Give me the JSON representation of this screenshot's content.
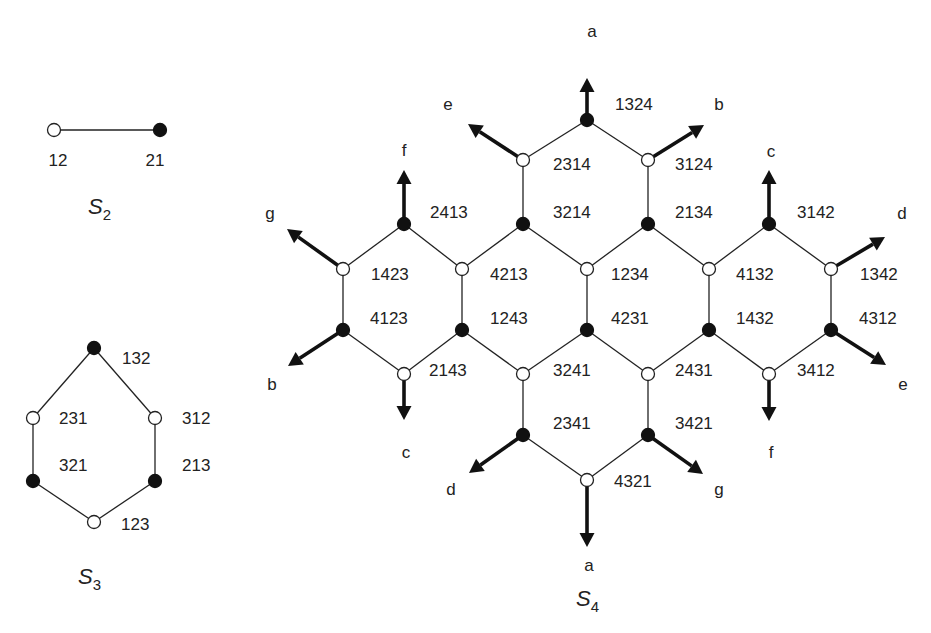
{
  "figure": {
    "colors": {
      "line": "#222222",
      "filled_node": "#111111",
      "open_node": "#ffffff",
      "background": "#ffffff"
    }
  },
  "panels": [
    {
      "id": "S2",
      "title": "S",
      "subscript": "2",
      "title_pos": [
        88,
        214
      ],
      "nodes": [
        {
          "id": "12",
          "x": 54,
          "y": 130,
          "type": "open",
          "label": "12",
          "lx": 58,
          "ly": 166,
          "anchor": "middle"
        },
        {
          "id": "21",
          "x": 160,
          "y": 130,
          "type": "filled",
          "label": "21",
          "lx": 155,
          "ly": 166,
          "anchor": "middle"
        }
      ],
      "edges": [
        [
          "12",
          "21"
        ]
      ],
      "arrows": []
    },
    {
      "id": "S3",
      "title": "S",
      "subscript": "3",
      "title_pos": [
        78,
        584
      ],
      "nodes": [
        {
          "id": "132",
          "x": 94,
          "y": 348,
          "type": "filled",
          "label": "132",
          "lx": 122,
          "ly": 364,
          "anchor": "start"
        },
        {
          "id": "231",
          "x": 33,
          "y": 418,
          "type": "open",
          "label": "231",
          "lx": 59,
          "ly": 424,
          "anchor": "start"
        },
        {
          "id": "312",
          "x": 155,
          "y": 418,
          "type": "open",
          "label": "312",
          "lx": 182,
          "ly": 424,
          "anchor": "start"
        },
        {
          "id": "321",
          "x": 33,
          "y": 481,
          "type": "filled",
          "label": "321",
          "lx": 59,
          "ly": 471,
          "anchor": "start"
        },
        {
          "id": "213",
          "x": 155,
          "y": 481,
          "type": "filled",
          "label": "213",
          "lx": 182,
          "ly": 471,
          "anchor": "start"
        },
        {
          "id": "123",
          "x": 94,
          "y": 522,
          "type": "open",
          "label": "123",
          "lx": 121,
          "ly": 530,
          "anchor": "start"
        }
      ],
      "edges": [
        [
          "132",
          "231"
        ],
        [
          "132",
          "312"
        ],
        [
          "231",
          "321"
        ],
        [
          "312",
          "213"
        ],
        [
          "321",
          "123"
        ],
        [
          "213",
          "123"
        ]
      ],
      "arrows": []
    },
    {
      "id": "S4",
      "title": "S",
      "subscript": "4",
      "title_pos": [
        576,
        606
      ],
      "nodes": [
        {
          "id": "1324",
          "x": 587,
          "y": 120,
          "type": "filled",
          "label": "1324",
          "lx": 615,
          "ly": 110,
          "anchor": "start"
        },
        {
          "id": "2314",
          "x": 523,
          "y": 160,
          "type": "open",
          "label": "2314",
          "lx": 553,
          "ly": 170,
          "anchor": "start"
        },
        {
          "id": "3124",
          "x": 648,
          "y": 160,
          "type": "open",
          "label": "3124",
          "lx": 675,
          "ly": 170,
          "anchor": "start"
        },
        {
          "id": "3214",
          "x": 523,
          "y": 224,
          "type": "filled",
          "label": "3214",
          "lx": 553,
          "ly": 218,
          "anchor": "start"
        },
        {
          "id": "2134",
          "x": 648,
          "y": 224,
          "type": "filled",
          "label": "2134",
          "lx": 675,
          "ly": 218,
          "anchor": "start"
        },
        {
          "id": "2413",
          "x": 404,
          "y": 224,
          "type": "filled",
          "label": "2413",
          "lx": 430,
          "ly": 218,
          "anchor": "start"
        },
        {
          "id": "3142",
          "x": 769,
          "y": 224,
          "type": "filled",
          "label": "3142",
          "lx": 797,
          "ly": 218,
          "anchor": "start"
        },
        {
          "id": "1423",
          "x": 343,
          "y": 269,
          "type": "open",
          "label": "1423",
          "lx": 371,
          "ly": 280,
          "anchor": "start"
        },
        {
          "id": "4213",
          "x": 462,
          "y": 269,
          "type": "open",
          "label": "4213",
          "lx": 490,
          "ly": 280,
          "anchor": "start"
        },
        {
          "id": "1234",
          "x": 587,
          "y": 269,
          "type": "open",
          "label": "1234",
          "lx": 611,
          "ly": 280,
          "anchor": "start"
        },
        {
          "id": "4132",
          "x": 709,
          "y": 269,
          "type": "open",
          "label": "4132",
          "lx": 736,
          "ly": 280,
          "anchor": "start"
        },
        {
          "id": "1342",
          "x": 831,
          "y": 269,
          "type": "open",
          "label": "1342",
          "lx": 860,
          "ly": 280,
          "anchor": "start"
        },
        {
          "id": "4123",
          "x": 343,
          "y": 330,
          "type": "filled",
          "label": "4123",
          "lx": 370,
          "ly": 324,
          "anchor": "start"
        },
        {
          "id": "1243",
          "x": 462,
          "y": 330,
          "type": "filled",
          "label": "1243",
          "lx": 490,
          "ly": 324,
          "anchor": "start"
        },
        {
          "id": "4231",
          "x": 587,
          "y": 330,
          "type": "filled",
          "label": "4231",
          "lx": 611,
          "ly": 324,
          "anchor": "start"
        },
        {
          "id": "1432",
          "x": 709,
          "y": 330,
          "type": "filled",
          "label": "1432",
          "lx": 736,
          "ly": 324,
          "anchor": "start"
        },
        {
          "id": "4312",
          "x": 831,
          "y": 330,
          "type": "filled",
          "label": "4312",
          "lx": 859,
          "ly": 324,
          "anchor": "start"
        },
        {
          "id": "2143",
          "x": 404,
          "y": 374,
          "type": "open",
          "label": "2143",
          "lx": 429,
          "ly": 376,
          "anchor": "start"
        },
        {
          "id": "3241",
          "x": 523,
          "y": 374,
          "type": "open",
          "label": "3241",
          "lx": 553,
          "ly": 376,
          "anchor": "start"
        },
        {
          "id": "2431",
          "x": 648,
          "y": 374,
          "type": "open",
          "label": "2431",
          "lx": 675,
          "ly": 376,
          "anchor": "start"
        },
        {
          "id": "3412",
          "x": 769,
          "y": 374,
          "type": "open",
          "label": "3412",
          "lx": 797,
          "ly": 376,
          "anchor": "start"
        },
        {
          "id": "2341",
          "x": 523,
          "y": 435,
          "type": "filled",
          "label": "2341",
          "lx": 553,
          "ly": 429,
          "anchor": "start"
        },
        {
          "id": "3421",
          "x": 648,
          "y": 435,
          "type": "filled",
          "label": "3421",
          "lx": 675,
          "ly": 429,
          "anchor": "start"
        },
        {
          "id": "4321",
          "x": 587,
          "y": 480,
          "type": "open",
          "label": "4321",
          "lx": 614,
          "ly": 487,
          "anchor": "start"
        }
      ],
      "edges": [
        [
          "1324",
          "2314"
        ],
        [
          "1324",
          "3124"
        ],
        [
          "2314",
          "3214"
        ],
        [
          "3124",
          "2134"
        ],
        [
          "2413",
          "1423"
        ],
        [
          "2413",
          "4213"
        ],
        [
          "3214",
          "4213"
        ],
        [
          "3214",
          "1234"
        ],
        [
          "2134",
          "1234"
        ],
        [
          "2134",
          "4132"
        ],
        [
          "3142",
          "4132"
        ],
        [
          "3142",
          "1342"
        ],
        [
          "1423",
          "4123"
        ],
        [
          "4213",
          "1243"
        ],
        [
          "1234",
          "4231"
        ],
        [
          "4132",
          "1432"
        ],
        [
          "1342",
          "4312"
        ],
        [
          "4123",
          "2143"
        ],
        [
          "1243",
          "2143"
        ],
        [
          "1243",
          "3241"
        ],
        [
          "4231",
          "3241"
        ],
        [
          "4231",
          "2431"
        ],
        [
          "1432",
          "2431"
        ],
        [
          "1432",
          "3412"
        ],
        [
          "4312",
          "3412"
        ],
        [
          "3241",
          "2341"
        ],
        [
          "2431",
          "3421"
        ],
        [
          "2341",
          "4321"
        ],
        [
          "3421",
          "4321"
        ]
      ],
      "arrows": [
        {
          "from": "1324",
          "tx": 587,
          "ty": 78,
          "label": "a",
          "lx": 592,
          "ly": 37
        },
        {
          "from": "2314",
          "tx": 468,
          "ty": 124,
          "label": "e",
          "lx": 448,
          "ly": 110
        },
        {
          "from": "3124",
          "tx": 704,
          "ty": 125,
          "label": "b",
          "lx": 719,
          "ly": 110
        },
        {
          "from": "2413",
          "tx": 404,
          "ty": 170,
          "label": "f",
          "lx": 404,
          "ly": 156
        },
        {
          "from": "3142",
          "tx": 769,
          "ty": 170,
          "label": "c",
          "lx": 771,
          "ly": 157
        },
        {
          "from": "1423",
          "tx": 287,
          "ty": 229,
          "label": "g",
          "lx": 270,
          "ly": 219
        },
        {
          "from": "1342",
          "tx": 885,
          "ty": 237,
          "label": "d",
          "lx": 902,
          "ly": 219
        },
        {
          "from": "4123",
          "tx": 288,
          "ty": 366,
          "label": "b",
          "lx": 272,
          "ly": 390
        },
        {
          "from": "4312",
          "tx": 886,
          "ty": 365,
          "label": "e",
          "lx": 903,
          "ly": 390
        },
        {
          "from": "2143",
          "tx": 404,
          "ty": 420,
          "label": "c",
          "lx": 406,
          "ly": 458
        },
        {
          "from": "3412",
          "tx": 769,
          "ty": 421,
          "label": "f",
          "lx": 771,
          "ly": 458
        },
        {
          "from": "2341",
          "tx": 469,
          "ty": 473,
          "label": "d",
          "lx": 451,
          "ly": 495
        },
        {
          "from": "3421",
          "tx": 703,
          "ty": 474,
          "label": "g",
          "lx": 719,
          "ly": 495
        },
        {
          "from": "4321",
          "tx": 587,
          "ty": 547,
          "label": "a",
          "lx": 589,
          "ly": 571
        }
      ]
    }
  ]
}
